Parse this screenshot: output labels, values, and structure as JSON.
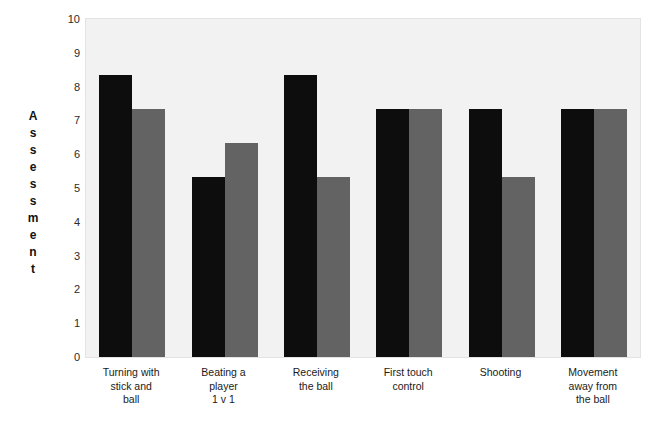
{
  "chart_data": {
    "type": "bar",
    "title": "",
    "xlabel": "",
    "ylabel": "Assessment",
    "ylim": [
      0,
      10
    ],
    "yticks": [
      10,
      9,
      8,
      7,
      6,
      5,
      4,
      3,
      2,
      1,
      0
    ],
    "grid": false,
    "legend": "none",
    "categories": [
      "Turning with stick and ball",
      "Beating a player 1 v 1",
      "Receiving the ball",
      "First touch control",
      "Shooting",
      "Movement away from the ball"
    ],
    "category_lines": [
      [
        "Turning with",
        "stick and",
        "ball"
      ],
      [
        "Beating a",
        "player",
        "1 v 1"
      ],
      [
        "Receiving",
        "the ball"
      ],
      [
        "First touch",
        "control"
      ],
      [
        "Shooting"
      ],
      [
        "Movement",
        "away from",
        "the ball"
      ]
    ],
    "series": [
      {
        "name": "Series 1",
        "color": "#0d0d0d",
        "values": [
          8.33,
          5.33,
          8.33,
          7.33,
          7.33,
          7.33
        ]
      },
      {
        "name": "Series 2",
        "color": "#636363",
        "values": [
          7.33,
          6.33,
          5.33,
          7.33,
          5.33,
          7.33
        ]
      }
    ]
  },
  "colors": {
    "plot_background": "#f2f2f2",
    "page_background": "#ffffff",
    "series_a": "#0d0d0d",
    "series_b": "#636363",
    "text": "#1a1a1a"
  }
}
